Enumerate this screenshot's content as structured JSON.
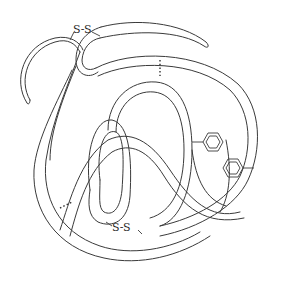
{
  "diagram": {
    "labels": {
      "disulfide_top": "S-S",
      "disulfide_bottom": "S-S"
    },
    "elements": [
      {
        "type": "polypeptide-chain",
        "style": "double-line ribbon"
      },
      {
        "type": "disulfide-bond",
        "label": "S-S",
        "position": "top-left"
      },
      {
        "type": "disulfide-bond",
        "label": "S-S",
        "position": "bottom-center"
      },
      {
        "type": "hydrogen-bond",
        "style": "dotted",
        "position": "top-center"
      },
      {
        "type": "hydrogen-bond",
        "style": "dotted",
        "position": "lower-left"
      },
      {
        "type": "hydrophobic-interaction",
        "icon": "benzene-ring-icon",
        "count": 2,
        "position": "right"
      }
    ],
    "colors": {
      "line": "#3a3a3a",
      "background": "#ffffff"
    }
  }
}
